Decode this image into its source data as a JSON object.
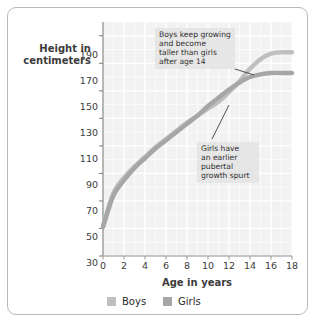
{
  "chart_data": {
    "type": "line",
    "title": "",
    "xlabel": "Age in years",
    "ylabel": "Height in centimeters",
    "xlim": [
      0,
      18
    ],
    "ylim": [
      30,
      200
    ],
    "xticks": [
      0,
      2,
      4,
      6,
      8,
      10,
      12,
      14,
      16,
      18
    ],
    "yticks": [
      30,
      50,
      70,
      90,
      110,
      130,
      150,
      170,
      190
    ],
    "grid": true,
    "legend_position": "bottom",
    "x": [
      0,
      1,
      2,
      3,
      4,
      5,
      6,
      7,
      8,
      9,
      10,
      11,
      12,
      13,
      14,
      15,
      16,
      17,
      18
    ],
    "series": [
      {
        "name": "Boys",
        "color": "#bfbfbf",
        "values": [
          52,
          76,
          87,
          95,
          102,
          109,
          115,
          121,
          127,
          132,
          137,
          142,
          149,
          157,
          166,
          173,
          177,
          178,
          178
        ]
      },
      {
        "name": "Girls",
        "color": "#a6a6a6",
        "values": [
          51,
          74,
          85,
          94,
          101,
          108,
          114,
          120,
          126,
          132,
          139,
          145,
          151,
          156,
          160,
          162,
          163,
          163,
          163
        ]
      }
    ],
    "annotations": [
      {
        "id": "boys-note",
        "lines": [
          "Boys keep growing",
          "and become",
          "taller than girls",
          "after age 14"
        ],
        "points_to": {
          "x": 15.4,
          "y": 172
        }
      },
      {
        "id": "girls-note",
        "lines": [
          "Girls have",
          "an earlier",
          "pubertal",
          "growth spurt"
        ],
        "points_to": {
          "x": 12.2,
          "y": 152
        }
      }
    ]
  },
  "axis": {
    "y_label_line1": "Height in",
    "y_label_line2": "centimeters",
    "x_label": "Age in years",
    "y_tick_190": "190",
    "y_tick_170": "170",
    "y_tick_150": "150",
    "y_tick_130": "130",
    "y_tick_110": "110",
    "y_tick_90": "90",
    "y_tick_70": "70",
    "y_tick_50": "50",
    "y_tick_30": "30",
    "x_tick_0": "0",
    "x_tick_2": "2",
    "x_tick_4": "4",
    "x_tick_6": "6",
    "x_tick_8": "8",
    "x_tick_10": "10",
    "x_tick_12": "12",
    "x_tick_14": "14",
    "x_tick_16": "16",
    "x_tick_18": "18"
  },
  "annotations": {
    "boys": {
      "line1": "Boys keep growing",
      "line2": "and become",
      "line3": "taller than girls",
      "line4": "after age 14"
    },
    "girls": {
      "line1": "Girls have",
      "line2": "an earlier",
      "line3": "pubertal",
      "line4": "growth spurt"
    }
  },
  "legend": {
    "boys_label": "Boys",
    "girls_label": "Girls",
    "boys_color": "#bfbfbf",
    "girls_color": "#a6a6a6"
  },
  "style": {
    "plot_background": "#f2f2f2",
    "gridline_color": "#ffffff",
    "frame_color": "#b9b9b9",
    "annotation_background": "#e6e6e6"
  }
}
